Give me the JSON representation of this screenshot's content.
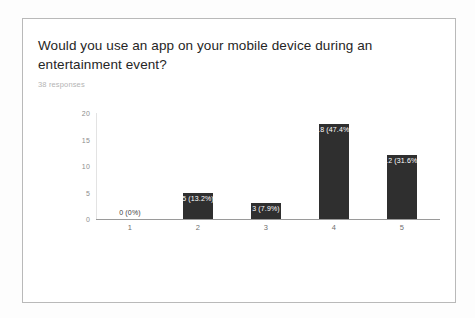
{
  "card": {
    "title": "Would you use an app on your mobile device during an entertainment event?",
    "response_count": "38 responses"
  },
  "chart_data": {
    "type": "bar",
    "title": "Would you use an app on your mobile device during an entertainment event?",
    "subtitle": "38 responses",
    "xlabel": "",
    "ylabel": "",
    "categories": [
      "1",
      "2",
      "3",
      "4",
      "5"
    ],
    "values": [
      0,
      5,
      3,
      18,
      12
    ],
    "data_labels": [
      "0 (0%)",
      "5 (13.2%)",
      "3 (7.9%)",
      "18 (47.4%)",
      "12 (31.6%)"
    ],
    "percentages": [
      "0%",
      "13.2%",
      "7.9%",
      "47.4%",
      "31.6%"
    ],
    "ylim": [
      0,
      20
    ],
    "yticks": [
      "0",
      "5",
      "10",
      "15",
      "20"
    ],
    "ytick_values": [
      0,
      5,
      10,
      15,
      20
    ],
    "grid": false,
    "legend": "none",
    "bar_color": "#2f2f2f",
    "total_responses": 38
  }
}
